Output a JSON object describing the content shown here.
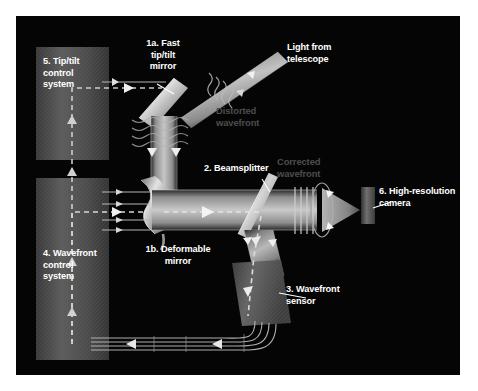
{
  "figure": {
    "background_color": "#ffffff",
    "panel_color": "#050505",
    "label_color": "#ffffff",
    "ghost_label_color": "#4e4e4e",
    "beam_color": "#9a9a9a",
    "control_box_color": "#4a4a4a"
  },
  "labels": {
    "tip_tilt_control": "5. Tip/tilt\ncontrol\nsystem",
    "fast_tip_tilt_mirror": "1a. Fast\ntip/tilt\nmirror",
    "light_from_telescope": "Light from\ntelescope",
    "distorted_wavefront": "Distorted\nwavefront",
    "beamsplitter": "2. Beamsplitter",
    "corrected_wavefront": "Corrected\nwavefront",
    "high_resolution_camera": "6. High-resolution\ncamera",
    "deformable_mirror": "1b. Deformable\nmirror",
    "wavefront_control": "4. Wavefront\ncontrol\nsystem",
    "wavefront_sensor": "3. Wavefront\nsensor"
  },
  "components": [
    {
      "id": "1a",
      "name": "Fast tip/tilt mirror"
    },
    {
      "id": "1b",
      "name": "Deformable mirror"
    },
    {
      "id": "2",
      "name": "Beamsplitter"
    },
    {
      "id": "3",
      "name": "Wavefront sensor"
    },
    {
      "id": "4",
      "name": "Wavefront control system"
    },
    {
      "id": "5",
      "name": "Tip/tilt control system"
    },
    {
      "id": "6",
      "name": "High-resolution camera"
    }
  ]
}
